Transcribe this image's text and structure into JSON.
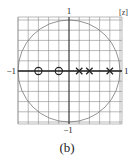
{
  "figure": {
    "caption": "(b)",
    "plane_label": "[z]",
    "axis_labels": {
      "top": "1",
      "bottom": "−1",
      "left": "−1",
      "right": "1"
    }
  },
  "chart_data": {
    "type": "pole-zero plot",
    "title": "",
    "plane": "z",
    "unit_circle": true,
    "grid": true,
    "xlim": [
      -1.05,
      1.05
    ],
    "ylim": [
      -1.05,
      1.05
    ],
    "zeros": [
      {
        "re": -0.6,
        "im": 0
      },
      {
        "re": -0.2,
        "im": 0
      }
    ],
    "poles": [
      {
        "re": 0.2,
        "im": 0
      },
      {
        "re": 0.4,
        "im": 0
      },
      {
        "re": 0.8,
        "im": 0
      }
    ],
    "tick_labels": [
      "-1",
      "1",
      "-1",
      "1"
    ],
    "caption": "(b)"
  }
}
